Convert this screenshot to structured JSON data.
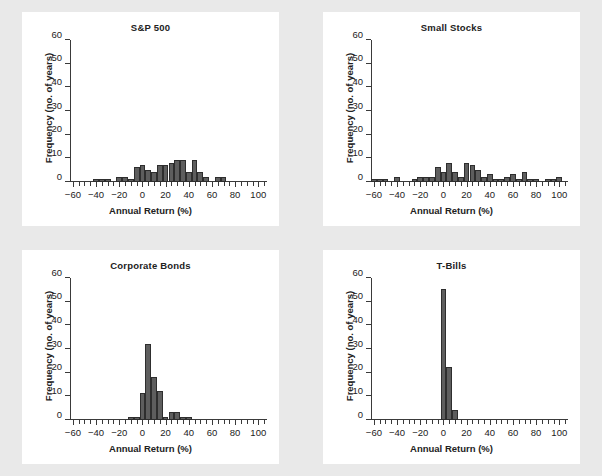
{
  "page": {
    "background_color": "#e9e9e9",
    "panel_color": "#ffffff",
    "bar_color": "#5e5e5e",
    "bar_edge_color": "#2e2e2e",
    "axis_color": "#3a3a3a"
  },
  "axes": {
    "ylabel": "Frequency (no. of years)",
    "xlabel": "Annual Return (%)",
    "ytick_labels": [
      "0",
      "10",
      "20",
      "30",
      "40",
      "50",
      "60"
    ],
    "ytick_values": [
      0,
      10,
      20,
      30,
      40,
      50,
      60
    ],
    "xtick_labels": [
      "−60",
      "−40",
      "−20",
      "0",
      "20",
      "40",
      "60",
      "80",
      "100"
    ],
    "xtick_values": [
      -60,
      -40,
      -20,
      0,
      20,
      40,
      60,
      80,
      100
    ],
    "ylim": [
      0,
      60
    ],
    "xlim": [
      -62.5,
      107.5
    ],
    "bin_width": 5,
    "minor_tick_step": 5
  },
  "chart_data": [
    {
      "type": "bar",
      "title": "S&P 500",
      "xlabel": "Annual Return (%)",
      "ylabel": "Frequency (no. of years)",
      "xlim": [
        -62.5,
        107.5
      ],
      "ylim": [
        0,
        60
      ],
      "grid": false,
      "legend": "none",
      "bin_width": 5,
      "bin_starts": [
        -60,
        -55,
        -50,
        -45,
        -40,
        -35,
        -30,
        -25,
        -20,
        -15,
        -10,
        -5,
        0,
        5,
        10,
        15,
        20,
        25,
        30,
        35,
        40,
        45,
        50,
        55,
        60,
        65,
        70,
        75,
        80,
        85,
        90,
        95,
        100
      ],
      "values": [
        0,
        0,
        0,
        0,
        1,
        1,
        1,
        0,
        2,
        2,
        1,
        6,
        7,
        5,
        4,
        7,
        7,
        8,
        9,
        9,
        4,
        9,
        4,
        2,
        0,
        2,
        2,
        0,
        0,
        0,
        0,
        0,
        0
      ]
    },
    {
      "type": "bar",
      "title": "Small Stocks",
      "xlabel": "Annual Return (%)",
      "ylabel": "Frequency (no. of years)",
      "xlim": [
        -62.5,
        107.5
      ],
      "ylim": [
        0,
        60
      ],
      "grid": false,
      "legend": "none",
      "bin_width": 5,
      "bin_starts": [
        -60,
        -55,
        -50,
        -45,
        -40,
        -35,
        -30,
        -25,
        -20,
        -15,
        -10,
        -5,
        0,
        5,
        10,
        15,
        20,
        25,
        30,
        35,
        40,
        45,
        50,
        55,
        60,
        65,
        70,
        75,
        80,
        85,
        90,
        95,
        100
      ],
      "values": [
        1,
        1,
        1,
        0,
        2,
        0,
        0,
        1,
        2,
        2,
        2,
        6,
        4,
        8,
        4,
        2,
        8,
        7,
        5,
        2,
        3,
        1,
        1,
        2,
        3,
        1,
        4,
        1,
        1,
        0,
        1,
        1,
        2
      ]
    },
    {
      "type": "bar",
      "title": "Corporate Bonds",
      "xlabel": "Annual Return (%)",
      "ylabel": "Frequency (no. of years)",
      "xlim": [
        -62.5,
        107.5
      ],
      "ylim": [
        0,
        60
      ],
      "grid": false,
      "legend": "none",
      "bin_width": 5,
      "bin_starts": [
        -60,
        -55,
        -50,
        -45,
        -40,
        -35,
        -30,
        -25,
        -20,
        -15,
        -10,
        -5,
        0,
        5,
        10,
        15,
        20,
        25,
        30,
        35,
        40,
        45,
        50,
        55,
        60,
        65,
        70,
        75,
        80,
        85,
        90,
        95,
        100
      ],
      "values": [
        0,
        0,
        0,
        0,
        0,
        0,
        0,
        0,
        0,
        0,
        1,
        1,
        11,
        32,
        18,
        12,
        1,
        3,
        3,
        1,
        1,
        0,
        0,
        0,
        0,
        0,
        0,
        0,
        0,
        0,
        0,
        0,
        0
      ]
    },
    {
      "type": "bar",
      "title": "T-Bills",
      "xlabel": "Annual Return (%)",
      "ylabel": "Frequency (no. of years)",
      "xlim": [
        -62.5,
        107.5
      ],
      "ylim": [
        0,
        60
      ],
      "grid": false,
      "legend": "none",
      "bin_width": 5,
      "bin_starts": [
        -60,
        -55,
        -50,
        -45,
        -40,
        -35,
        -30,
        -25,
        -20,
        -15,
        -10,
        -5,
        0,
        5,
        10,
        15,
        20,
        25,
        30,
        35,
        40,
        45,
        50,
        55,
        60,
        65,
        70,
        75,
        80,
        85,
        90,
        95,
        100
      ],
      "values": [
        0,
        0,
        0,
        0,
        0,
        0,
        0,
        0,
        0,
        0,
        0,
        0,
        55,
        22,
        4,
        0,
        0,
        0,
        0,
        0,
        0,
        0,
        0,
        0,
        0,
        0,
        0,
        0,
        0,
        0,
        0,
        0,
        0
      ]
    }
  ]
}
